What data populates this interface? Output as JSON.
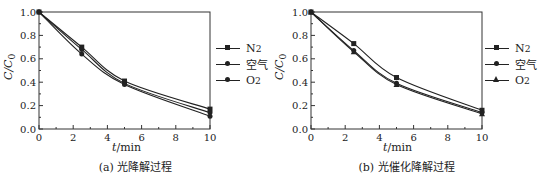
{
  "chart_data": [
    {
      "type": "line",
      "title": "(a) 光降解过程",
      "xlabel": "t/min",
      "ylabel": "C/C0",
      "xlim": [
        0,
        10
      ],
      "ylim": [
        0.0,
        1.0
      ],
      "xticks": [
        0,
        2,
        4,
        6,
        8,
        10
      ],
      "yticks": [
        0.0,
        0.2,
        0.4,
        0.6,
        0.8,
        1.0
      ],
      "legend_position": "right",
      "x": [
        0,
        2.5,
        5,
        10
      ],
      "series": [
        {
          "name": "N2",
          "marker": "square",
          "values": [
            1.0,
            0.7,
            0.41,
            0.17
          ]
        },
        {
          "name": "空气",
          "marker": "circle",
          "values": [
            1.0,
            0.68,
            0.39,
            0.14
          ]
        },
        {
          "name": "O2",
          "marker": "circle",
          "values": [
            1.0,
            0.64,
            0.38,
            0.11
          ]
        }
      ]
    },
    {
      "type": "line",
      "title": "(b) 光催化降解过程",
      "xlabel": "t/min",
      "ylabel": "C/C0",
      "xlim": [
        0,
        10
      ],
      "ylim": [
        0.0,
        1.0
      ],
      "xticks": [
        0,
        2,
        4,
        6,
        8,
        10
      ],
      "yticks": [
        0.0,
        0.2,
        0.4,
        0.6,
        0.8,
        1.0
      ],
      "legend_position": "right",
      "x": [
        0,
        2.5,
        5,
        10
      ],
      "series": [
        {
          "name": "N2",
          "marker": "square",
          "values": [
            1.0,
            0.73,
            0.44,
            0.16
          ]
        },
        {
          "name": "空气",
          "marker": "circle",
          "values": [
            1.0,
            0.67,
            0.39,
            0.14
          ]
        },
        {
          "name": "O2",
          "marker": "triangle",
          "values": [
            1.0,
            0.66,
            0.38,
            0.13
          ]
        }
      ]
    }
  ],
  "panels": [
    {
      "caption": "(a) 光降解过程",
      "xlabel_italic": "t",
      "xlabel_unit": "/min",
      "ylabel": "C/C",
      "ylabel_sub": "0",
      "legend": [
        {
          "label": "N",
          "sub": "2"
        },
        {
          "label": "空气",
          "sub": ""
        },
        {
          "label": "O",
          "sub": "2"
        }
      ]
    },
    {
      "caption": "(b) 光催化降解过程",
      "xlabel_italic": "t",
      "xlabel_unit": "/min",
      "ylabel": "C/C",
      "ylabel_sub": "0",
      "legend": [
        {
          "label": "N",
          "sub": "2"
        },
        {
          "label": "空气",
          "sub": ""
        },
        {
          "label": "O",
          "sub": "2"
        }
      ]
    }
  ]
}
